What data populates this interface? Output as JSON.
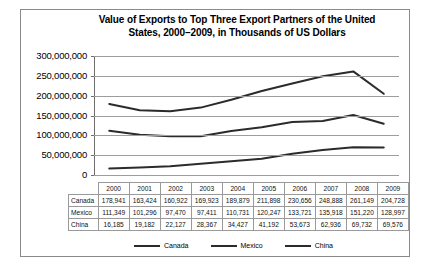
{
  "chart_data": {
    "type": "line",
    "title": "Value of Exports to Top Three Export Partners of the United States, 2000–2009, in Thousands of US Dollars",
    "title_line1": "Value of Exports to Top Three Export Partners of the United",
    "title_line2": "States, 2000–2009, in Thousands of US Dollars",
    "xlabel": "",
    "ylabel": "",
    "categories": [
      "2000",
      "2001",
      "2002",
      "2003",
      "2004",
      "2005",
      "2006",
      "2007",
      "2008",
      "2009"
    ],
    "ylim": [
      0,
      300000000
    ],
    "ytick_labels": [
      "300,000,000",
      "250,000,000",
      "200,000,000",
      "150,000,000",
      "100,000,000",
      "50,000,000",
      "0"
    ],
    "ytick_values": [
      300000000,
      250000000,
      200000000,
      150000000,
      100000000,
      50000000,
      0
    ],
    "grid": true,
    "legend_position": "bottom",
    "series": [
      {
        "name": "Canada",
        "color": "#2b2b2b",
        "values": [
          178941,
          163424,
          160922,
          169923,
          189879,
          211898,
          230656,
          248888,
          261149,
          204728
        ],
        "labels": [
          "178,941",
          "163,424",
          "160,922",
          "169,923",
          "189,879",
          "211,898",
          "230,656",
          "248,888",
          "261,149",
          "204,728"
        ]
      },
      {
        "name": "Mexico",
        "color": "#2b2b2b",
        "values": [
          111349,
          101296,
          97470,
          97411,
          110731,
          120247,
          133721,
          135918,
          151220,
          128997
        ],
        "labels": [
          "111,349",
          "101,296",
          "97,470",
          "97,411",
          "110,731",
          "120,247",
          "133,721",
          "135,918",
          "151,220",
          "128,997"
        ]
      },
      {
        "name": "China",
        "color": "#2b2b2b",
        "values": [
          16185,
          19182,
          22127,
          28367,
          34427,
          41192,
          53673,
          62936,
          69732,
          69576
        ],
        "labels": [
          "16,185",
          "19,182",
          "22,127",
          "28,367",
          "34,427",
          "41,192",
          "53,673",
          "62,936",
          "69,732",
          "69,576"
        ]
      }
    ]
  },
  "table": {
    "corner_label": "",
    "column_headers": [
      "2000",
      "2001",
      "2002",
      "2003",
      "2004",
      "2005",
      "2006",
      "2007",
      "2008",
      "2009"
    ],
    "rows": [
      {
        "label": "Canada",
        "cells": [
          "178,941",
          "163,424",
          "160,922",
          "169,923",
          "189,879",
          "211,898",
          "230,656",
          "248,888",
          "261,149",
          "204,728"
        ]
      },
      {
        "label": "Mexico",
        "cells": [
          "111,349",
          "101,296",
          "97,470",
          "97,411",
          "110,731",
          "120,247",
          "133,721",
          "135,918",
          "151,220",
          "128,997"
        ]
      },
      {
        "label": "China",
        "cells": [
          "16,185",
          "19,182",
          "22,127",
          "28,367",
          "34,427",
          "41,192",
          "53,673",
          "62,936",
          "69,732",
          "69,576"
        ]
      }
    ]
  },
  "legend": {
    "items": [
      {
        "label": "Canada",
        "color": "#2b2b2b"
      },
      {
        "label": "Mexico",
        "color": "#2b2b2b"
      },
      {
        "label": "China",
        "color": "#2b2b2b"
      }
    ]
  }
}
